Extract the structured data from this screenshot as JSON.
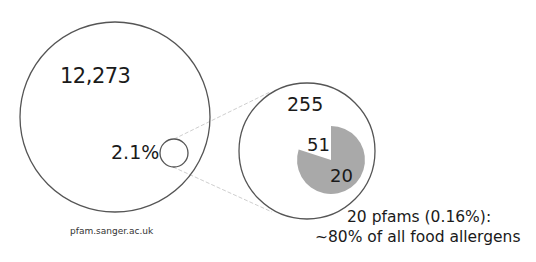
{
  "diagram": {
    "outer_circle": {
      "label": "12,273"
    },
    "subset_circle": {
      "label": "2.1%"
    },
    "zoom_circle": {
      "label": "255"
    },
    "pie": {
      "white_label": "51",
      "gray_label": "20",
      "gray_fraction": 0.8,
      "gray_color": "#a9a9a9"
    },
    "source": "pfam.sanger.ac.uk",
    "caption": {
      "line1": "20 pfams (0.16%):",
      "line2": "~80% of all food allergens"
    }
  },
  "colors": {
    "stroke": "#555555",
    "connector": "#cfcfcf",
    "pie_gray": "#a9a9a9"
  }
}
